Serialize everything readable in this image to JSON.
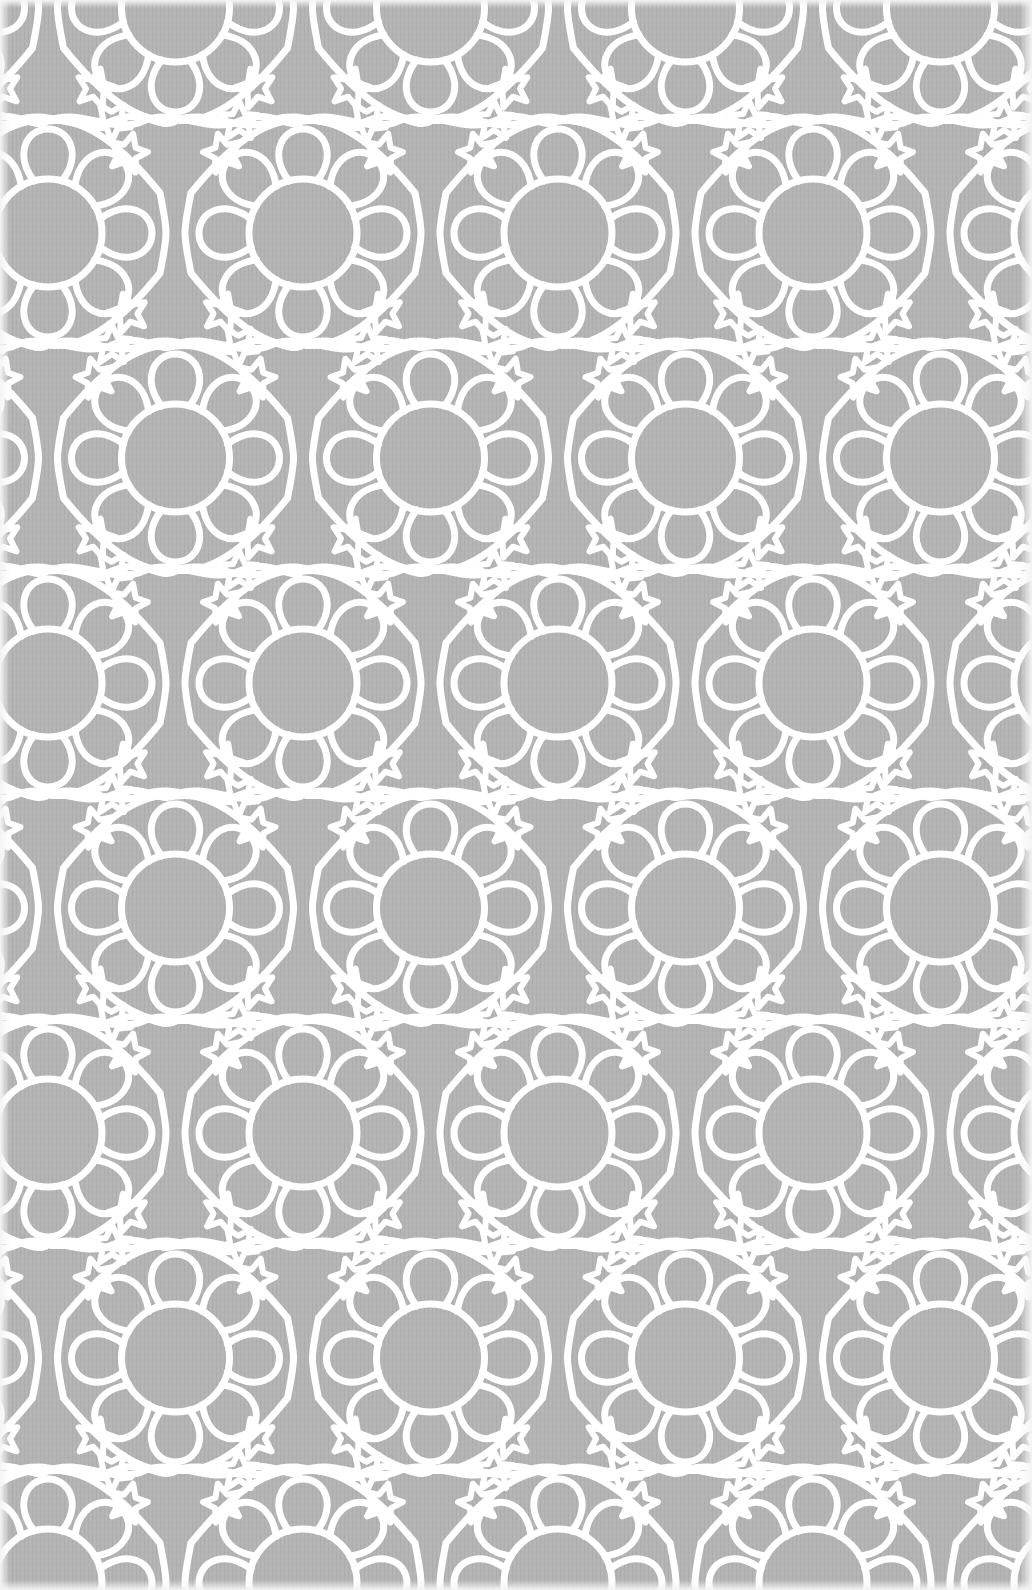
{
  "image": {
    "description": "Islamic-style geometric interlace pattern: white strapwork lines forming teardrop loops and five-pointed stars around open rosette centers, on a gray textured fabric background",
    "width": 1032,
    "height": 1590,
    "colors": {
      "background": "#b4b4b4",
      "texture_dark": "#aaaaaa",
      "line": "#ffffff",
      "edge": "#f2f2f2"
    },
    "pattern": {
      "motif": "rosette-with-teardrop-ring-and-stars",
      "repeat_x": 255,
      "repeat_y": 450,
      "row_offset_x": 127.5,
      "row_spacing_y": 225,
      "origin_x": 48,
      "origin_y": 233,
      "stroke_width": 7,
      "loops_per_rosette": 8,
      "star_points": 5
    },
    "rosette_rows": [
      {
        "y": 233,
        "xs": [
          48,
          303,
          558,
          813
        ]
      },
      {
        "y": 458,
        "xs": [
          175,
          430,
          685,
          940
        ]
      },
      {
        "y": 683,
        "xs": [
          48,
          303,
          558,
          813
        ]
      },
      {
        "y": 908,
        "xs": [
          175,
          430,
          685,
          940
        ]
      },
      {
        "y": 1133,
        "xs": [
          48,
          303,
          558,
          813
        ]
      },
      {
        "y": 1358,
        "xs": [
          175,
          430,
          685,
          940
        ]
      }
    ]
  }
}
